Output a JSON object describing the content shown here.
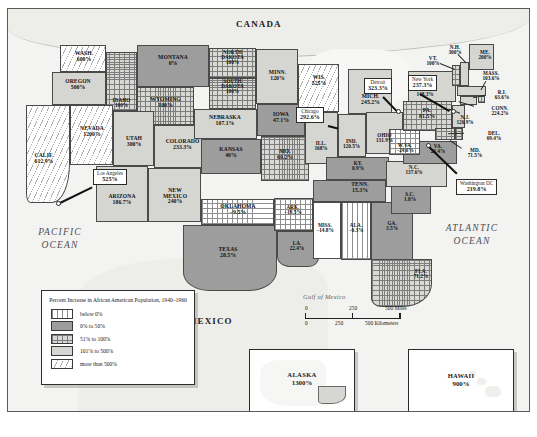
{
  "map": {
    "country_labels": [
      {
        "name": "CANADA"
      },
      {
        "name": "MEXICO"
      }
    ],
    "ocean_labels": [
      {
        "name": "PACIFIC\nOCEAN"
      },
      {
        "name": "ATLANTIC\nOCEAN"
      },
      {
        "name": "Gulf of Mexico"
      }
    ],
    "states": [
      {
        "name": "WASH.",
        "value": "600%",
        "band": "over500"
      },
      {
        "name": "OREGON",
        "value": "500%",
        "band": "101-500"
      },
      {
        "name": "IDAHO",
        "value": "100%",
        "band": "51-100"
      },
      {
        "name": "MONTANA",
        "value": "0%",
        "band": "0-50"
      },
      {
        "name": "WYOMING",
        "value": "100%",
        "band": "51-100"
      },
      {
        "name": "NORTH\nDAKOTA",
        "value": "100%",
        "band": "51-100"
      },
      {
        "name": "SOUTH\nDAKOTA",
        "value": "100%",
        "band": "51-100"
      },
      {
        "name": "NEVADA",
        "value": "1200%",
        "band": "over500"
      },
      {
        "name": "CALIF.",
        "value": "612.9%",
        "band": "over500"
      },
      {
        "name": "UTAH",
        "value": "300%",
        "band": "101-500"
      },
      {
        "name": "COLORADO",
        "value": "233.3%",
        "band": "101-500"
      },
      {
        "name": "ARIZONA",
        "value": "186.7%",
        "band": "101-500"
      },
      {
        "name": "NEW\nMEXICO",
        "value": "240%",
        "band": "101-500"
      },
      {
        "name": "NEBRASKA",
        "value": "107.1%",
        "band": "101-500"
      },
      {
        "name": "KANSAS",
        "value": "40%",
        "band": "0-50"
      },
      {
        "name": "OKLAHOMA",
        "value": "−9.5%",
        "band": "below0"
      },
      {
        "name": "TEXAS",
        "value": "28.5%",
        "band": "0-50"
      },
      {
        "name": "MINN.",
        "value": "120%",
        "band": "101-500"
      },
      {
        "name": "IOWA",
        "value": "47.1%",
        "band": "0-50"
      },
      {
        "name": "MO.",
        "value": "60.2%",
        "band": "51-100"
      },
      {
        "name": "ARK.",
        "value": "−19.5%",
        "band": "below0"
      },
      {
        "name": "LA.",
        "value": "22.4%",
        "band": "0-50"
      },
      {
        "name": "WIS.",
        "value": "525%",
        "band": "over500"
      },
      {
        "name": "ILL.",
        "value": "168%",
        "band": "101-500"
      },
      {
        "name": "MISS.",
        "value": "−14.8%",
        "band": "below0"
      },
      {
        "name": "MICH.",
        "value": "245.2%",
        "band": "101-500"
      },
      {
        "name": "IND.",
        "value": "120.5%",
        "band": "101-500"
      },
      {
        "name": "OHIO",
        "value": "131.9%",
        "band": "101-500"
      },
      {
        "name": "KY.",
        "value": "0.9%",
        "band": "0-50"
      },
      {
        "name": "TENN.",
        "value": "15.3%",
        "band": "0-50"
      },
      {
        "name": "ALA.",
        "value": "−0.3%",
        "band": "below0"
      },
      {
        "name": "GA.",
        "value": "3.5%",
        "band": "0-50"
      },
      {
        "name": "FLA.",
        "value": "71.2%",
        "band": "51-100"
      },
      {
        "name": "S.C.",
        "value": "1.8%",
        "band": "0-50"
      },
      {
        "name": "N.C.",
        "value": "137.6%",
        "band": "101-500"
      },
      {
        "name": "VA.",
        "value": "23.4%",
        "band": "0-50"
      },
      {
        "name": "W.VA.",
        "value": "−24.6%",
        "band": "below0"
      },
      {
        "name": "PA.",
        "value": "81.5%",
        "band": "51-100"
      },
      {
        "name": "N.Y.",
        "value": "148.3%",
        "band": "101-500"
      },
      {
        "name": "VT.",
        "value": "100%",
        "band": "51-100"
      },
      {
        "name": "N.H.",
        "value": "300%",
        "band": "101-500"
      },
      {
        "name": "ME.",
        "value": "200%",
        "band": "101-500"
      },
      {
        "name": "MASS.",
        "value": "103.6%",
        "band": "101-500"
      },
      {
        "name": "R.I.",
        "value": "63.6%",
        "band": "51-100"
      },
      {
        "name": "CONN.",
        "value": "224.2%",
        "band": "101-500"
      },
      {
        "name": "N.J.",
        "value": "126.9%",
        "band": "101-500"
      },
      {
        "name": "DEL.",
        "value": "69.4%",
        "band": "51-100"
      },
      {
        "name": "MD.",
        "value": "71.5%",
        "band": "51-100"
      }
    ],
    "cities": [
      {
        "name": "Los Angeles",
        "value": "525%"
      },
      {
        "name": "Chicago",
        "value": "292.6%"
      },
      {
        "name": "Detroit",
        "value": "323.3%"
      },
      {
        "name": "New York",
        "value": "237.3%"
      },
      {
        "name": "Washington DC",
        "value": "219.8%"
      }
    ],
    "insets": [
      {
        "name": "ALASKA",
        "value": "1300%"
      },
      {
        "name": "HAWAII",
        "value": "900%"
      }
    ]
  },
  "legend": {
    "title": "Percent Increase in African American Population, 1940–1960",
    "items": [
      {
        "label": "below 0%"
      },
      {
        "label": "0% to 50%"
      },
      {
        "label": "51% to 100%"
      },
      {
        "label": "101% to 500%"
      },
      {
        "label": "more than 500%"
      }
    ]
  },
  "scale": {
    "miles": {
      "t0": "0",
      "t1": "250",
      "t2": "500 Miles"
    },
    "kilometers": {
      "t0": "0",
      "t1": "250",
      "t2": "500 Kilometers"
    }
  }
}
